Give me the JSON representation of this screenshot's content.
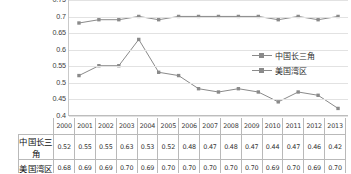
{
  "chart_data": {
    "type": "line",
    "title": "",
    "xlabel": "",
    "ylabel": "",
    "categories": [
      "2000",
      "2001",
      "2002",
      "2003",
      "2004",
      "2005",
      "2006",
      "2007",
      "2008",
      "2009",
      "2010",
      "2011",
      "2012",
      "2013"
    ],
    "series": [
      {
        "name": "中国长三角",
        "values": [
          0.52,
          0.55,
          0.55,
          0.63,
          0.53,
          0.52,
          0.48,
          0.47,
          0.48,
          0.47,
          0.44,
          0.47,
          0.46,
          0.42
        ],
        "color": "#8a8a8a",
        "marker": "square"
      },
      {
        "name": "美国湾区",
        "values": [
          0.68,
          0.69,
          0.69,
          0.7,
          0.69,
          0.7,
          0.7,
          0.7,
          0.7,
          0.7,
          0.69,
          0.7,
          0.69,
          0.7
        ],
        "color": "#8a8a8a",
        "marker": "square"
      }
    ],
    "ylim": [
      0.4,
      0.75
    ],
    "yticks": [
      "0.75",
      "0.7",
      "0.65",
      "0.6",
      "0.55",
      "0.5",
      "0.45",
      "0.4"
    ],
    "ytick_values": [
      0.75,
      0.7,
      0.65,
      0.6,
      0.55,
      0.5,
      0.45,
      0.4
    ],
    "grid": true,
    "legend_position": "right"
  },
  "legend": {
    "items": [
      {
        "label": "中国长三角"
      },
      {
        "label": "美国湾区"
      }
    ]
  },
  "table": {
    "row_labels": [
      "中国长三角",
      "美国湾区"
    ],
    "columns": [
      "2000",
      "2001",
      "2002",
      "2003",
      "2004",
      "2005",
      "2006",
      "2007",
      "2008",
      "2009",
      "2010",
      "2011",
      "2012",
      "2013"
    ],
    "rows": [
      [
        "0.52",
        "0.55",
        "0.55",
        "0.63",
        "0.53",
        "0.52",
        "0.48",
        "0.47",
        "0.48",
        "0.47",
        "0.44",
        "0.47",
        "0.46",
        "0.42"
      ],
      [
        "0.68",
        "0.69",
        "0.69",
        "0.70",
        "0.69",
        "0.70",
        "0.70",
        "0.70",
        "0.70",
        "0.70",
        "0.69",
        "0.70",
        "0.69",
        "0.70"
      ]
    ]
  },
  "colors": {
    "series": "#8a8a8a",
    "grid": "#e2e2e2",
    "axis": "#bdbdbd",
    "table_border": "#b9b9b9",
    "text": "#333333"
  }
}
